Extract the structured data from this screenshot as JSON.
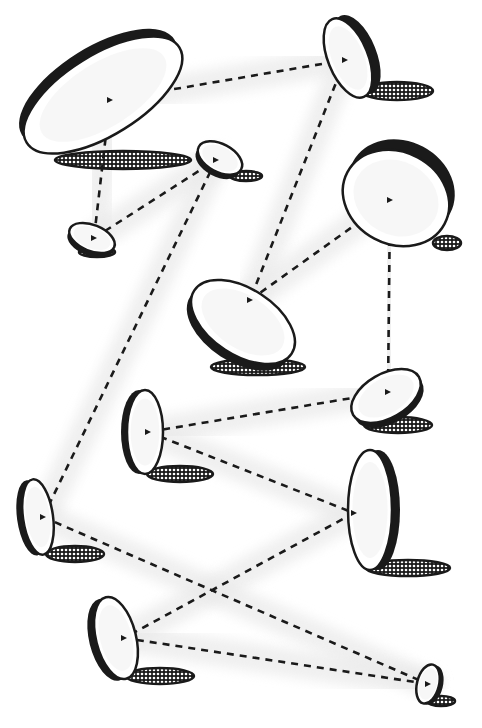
{
  "figure": {
    "title": "",
    "background": "#ffffff",
    "ink": "#1a1a1a",
    "haze": "#e9e9e9",
    "shadow_fill": "dotted",
    "discs": [
      {
        "id": "d1",
        "cx": 103,
        "cy": 95,
        "rx": 90,
        "ry": 40,
        "rot": -32,
        "rim": 9,
        "rimSide": "top",
        "shadow": {
          "cx": 123,
          "cy": 160,
          "rx": 68,
          "ry": 9
        },
        "focus": [
          110,
          100
        ]
      },
      {
        "id": "d2",
        "cx": 348,
        "cy": 58,
        "rx": 20,
        "ry": 42,
        "rot": -22,
        "rim": 9,
        "rimSide": "right",
        "shadow": {
          "cx": 397,
          "cy": 91,
          "rx": 36,
          "ry": 9
        },
        "focus": [
          345,
          60
        ]
      },
      {
        "id": "d3",
        "cx": 220,
        "cy": 158,
        "rx": 24,
        "ry": 14,
        "rot": 28,
        "rim": 5,
        "rimSide": "bottom",
        "shadow": {
          "cx": 246,
          "cy": 176,
          "rx": 16,
          "ry": 5
        },
        "focus": [
          216,
          160
        ]
      },
      {
        "id": "d4",
        "cx": 92,
        "cy": 238,
        "rx": 24,
        "ry": 13,
        "rot": 22,
        "rim": 5,
        "rimSide": "bottom",
        "shadow": {
          "cx": 97,
          "cy": 252,
          "rx": 18,
          "ry": 5
        },
        "focus": [
          94,
          238
        ]
      },
      {
        "id": "d5",
        "cx": 396,
        "cy": 198,
        "rx": 55,
        "ry": 46,
        "rot": 28,
        "rim": 12,
        "rimSide": "top",
        "shadow": {
          "cx": 447,
          "cy": 243,
          "rx": 14,
          "ry": 7
        },
        "focus": [
          390,
          200
        ]
      },
      {
        "id": "d6",
        "cx": 243,
        "cy": 322,
        "rx": 58,
        "ry": 33,
        "rot": 33,
        "rim": 8,
        "rimSide": "bottom",
        "shadow": {
          "cx": 258,
          "cy": 367,
          "rx": 47,
          "ry": 8
        },
        "focus": [
          250,
          300
        ]
      },
      {
        "id": "d7",
        "cx": 386,
        "cy": 396,
        "rx": 38,
        "ry": 22,
        "rot": -30,
        "rim": 6,
        "rimSide": "bottom",
        "shadow": {
          "cx": 398,
          "cy": 425,
          "rx": 34,
          "ry": 8
        },
        "focus": [
          388,
          392
        ]
      },
      {
        "id": "d8",
        "cx": 145,
        "cy": 432,
        "rx": 18,
        "ry": 42,
        "rot": 0,
        "rim": 6,
        "rimSide": "left",
        "shadow": {
          "cx": 180,
          "cy": 474,
          "rx": 33,
          "ry": 8
        },
        "focus": [
          148,
          432
        ]
      },
      {
        "id": "d9",
        "cx": 370,
        "cy": 510,
        "rx": 22,
        "ry": 60,
        "rot": 0,
        "rim": 8,
        "rimSide": "right",
        "shadow": {
          "cx": 408,
          "cy": 568,
          "rx": 42,
          "ry": 8
        },
        "focus": [
          354,
          513
        ]
      },
      {
        "id": "d10",
        "cx": 38,
        "cy": 517,
        "rx": 15,
        "ry": 38,
        "rot": -8,
        "rim": 6,
        "rimSide": "left",
        "shadow": {
          "cx": 75,
          "cy": 554,
          "rx": 29,
          "ry": 8
        },
        "focus": [
          43,
          517
        ]
      },
      {
        "id": "d11",
        "cx": 116,
        "cy": 638,
        "rx": 20,
        "ry": 42,
        "rot": -14,
        "rim": 7,
        "rimSide": "left",
        "shadow": {
          "cx": 160,
          "cy": 676,
          "rx": 34,
          "ry": 8
        },
        "focus": [
          124,
          638
        ]
      },
      {
        "id": "d12",
        "cx": 428,
        "cy": 684,
        "rx": 11,
        "ry": 20,
        "rot": 14,
        "rim": 4,
        "rimSide": "right",
        "shadow": {
          "cx": 441,
          "cy": 701,
          "rx": 14,
          "ry": 5
        },
        "focus": [
          428,
          684
        ]
      }
    ],
    "beams": [
      {
        "from": "d1",
        "to": "d2",
        "pts": [
          [
            110,
            100
          ],
          [
            345,
            60
          ]
        ]
      },
      {
        "from": "d1",
        "to": "d4",
        "pts": [
          [
            110,
            100
          ],
          [
            94,
            238
          ]
        ]
      },
      {
        "from": "d4",
        "to": "d3",
        "pts": [
          [
            94,
            238
          ],
          [
            216,
            160
          ]
        ]
      },
      {
        "from": "d3",
        "to": "d10",
        "pts": [
          [
            216,
            160
          ],
          [
            43,
            517
          ]
        ]
      },
      {
        "from": "d2",
        "to": "d6",
        "pts": [
          [
            345,
            60
          ],
          [
            250,
            300
          ]
        ]
      },
      {
        "from": "d6",
        "to": "d5",
        "pts": [
          [
            250,
            300
          ],
          [
            390,
            200
          ]
        ]
      },
      {
        "from": "d5",
        "to": "d7",
        "pts": [
          [
            390,
            200
          ],
          [
            388,
            392
          ]
        ]
      },
      {
        "from": "d7",
        "to": "d8",
        "pts": [
          [
            388,
            392
          ],
          [
            148,
            432
          ]
        ]
      },
      {
        "from": "d8",
        "to": "d9",
        "pts": [
          [
            148,
            432
          ],
          [
            354,
            513
          ]
        ]
      },
      {
        "from": "d9",
        "to": "d11",
        "pts": [
          [
            354,
            513
          ],
          [
            124,
            638
          ]
        ]
      },
      {
        "from": "d10",
        "to": "d12",
        "pts": [
          [
            43,
            517
          ],
          [
            428,
            684
          ]
        ]
      },
      {
        "from": "d11",
        "to": "d12",
        "pts": [
          [
            124,
            638
          ],
          [
            428,
            684
          ]
        ]
      }
    ]
  }
}
